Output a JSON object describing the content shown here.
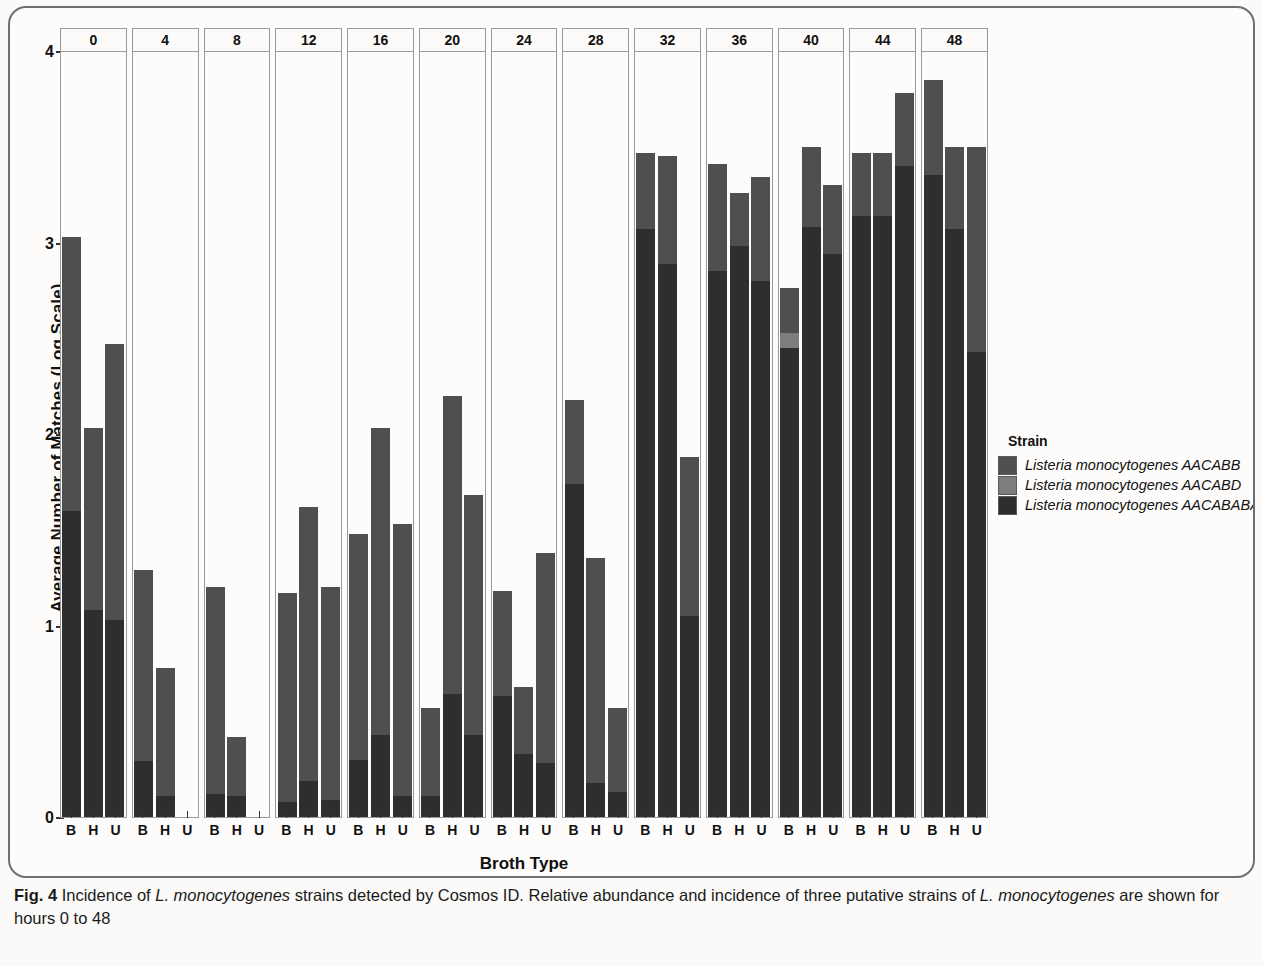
{
  "figure": {
    "label": "Fig. 4",
    "caption_part1": "Incidence of ",
    "caption_italic1": "L. monocytogenes",
    "caption_part2": " strains detected by Cosmos ID. Relative abundance and incidence of three putative strains of ",
    "caption_italic2": "L. monocytogenes",
    "caption_part3": " are shown for hours 0 to 48"
  },
  "legend": {
    "title": "Strain",
    "items": [
      {
        "label": "Listeria monocytogenes AACABB",
        "color": "#4f4f4f"
      },
      {
        "label": "Listeria monocytogenes AACABD",
        "color": "#7d7d7d"
      },
      {
        "label": "Listeria monocytogenes AACABABA",
        "color": "#2e2e2e"
      }
    ]
  },
  "chart_data": {
    "type": "bar",
    "subtype": "stacked-bar-faceted",
    "title": "",
    "xlabel": "Broth Type",
    "ylabel": "Average Number of Matches (Log Scale)",
    "ylim": [
      0,
      4
    ],
    "yticks": [
      0,
      1,
      2,
      3,
      4
    ],
    "grid": false,
    "legend_position": "right",
    "facet_label": "Hour",
    "facets": [
      "0",
      "4",
      "8",
      "12",
      "16",
      "20",
      "24",
      "28",
      "32",
      "36",
      "40",
      "44",
      "48"
    ],
    "categories": [
      "B",
      "H",
      "U"
    ],
    "series": [
      {
        "name": "Listeria monocytogenes AACABB",
        "color": "#4f4f4f"
      },
      {
        "name": "Listeria monocytogenes AACABD",
        "color": "#7d7d7d"
      },
      {
        "name": "Listeria monocytogenes AACABABA",
        "color": "#2e2e2e"
      }
    ],
    "panels": [
      {
        "facet": "0",
        "bars": [
          {
            "category": "B",
            "total": 3.03,
            "segments": [
              1.43,
              0.0,
              1.6
            ]
          },
          {
            "category": "H",
            "total": 2.03,
            "segments": [
              0.95,
              0.0,
              1.08
            ]
          },
          {
            "category": "U",
            "total": 2.47,
            "segments": [
              1.44,
              0.0,
              1.03
            ]
          }
        ]
      },
      {
        "facet": "4",
        "bars": [
          {
            "category": "B",
            "total": 1.29,
            "segments": [
              1.0,
              0.0,
              0.29
            ]
          },
          {
            "category": "H",
            "total": 0.78,
            "segments": [
              0.67,
              0.0,
              0.11
            ]
          },
          {
            "category": "U",
            "total": 0.0,
            "segments": [
              0.0,
              0.0,
              0.0
            ]
          }
        ]
      },
      {
        "facet": "8",
        "bars": [
          {
            "category": "B",
            "total": 1.2,
            "segments": [
              1.08,
              0.0,
              0.12
            ]
          },
          {
            "category": "H",
            "total": 0.42,
            "segments": [
              0.31,
              0.0,
              0.11
            ]
          },
          {
            "category": "U",
            "total": 0.0,
            "segments": [
              0.0,
              0.0,
              0.0
            ]
          }
        ]
      },
      {
        "facet": "12",
        "bars": [
          {
            "category": "B",
            "total": 1.17,
            "segments": [
              1.09,
              0.0,
              0.08
            ]
          },
          {
            "category": "H",
            "total": 1.62,
            "segments": [
              1.43,
              0.0,
              0.19
            ]
          },
          {
            "category": "U",
            "total": 1.2,
            "segments": [
              1.11,
              0.0,
              0.09
            ]
          }
        ]
      },
      {
        "facet": "16",
        "bars": [
          {
            "category": "B",
            "total": 1.48,
            "segments": [
              1.18,
              0.0,
              0.3
            ]
          },
          {
            "category": "H",
            "total": 2.03,
            "segments": [
              1.6,
              0.0,
              0.43
            ]
          },
          {
            "category": "U",
            "total": 1.53,
            "segments": [
              1.42,
              0.0,
              0.11
            ]
          }
        ]
      },
      {
        "facet": "20",
        "bars": [
          {
            "category": "B",
            "total": 0.57,
            "segments": [
              0.46,
              0.0,
              0.11
            ]
          },
          {
            "category": "H",
            "total": 2.2,
            "segments": [
              1.56,
              0.0,
              0.64
            ]
          },
          {
            "category": "U",
            "total": 1.68,
            "segments": [
              1.25,
              0.0,
              0.43
            ]
          }
        ]
      },
      {
        "facet": "24",
        "bars": [
          {
            "category": "B",
            "total": 1.18,
            "segments": [
              0.55,
              0.0,
              0.63
            ]
          },
          {
            "category": "H",
            "total": 0.68,
            "segments": [
              0.35,
              0.0,
              0.33
            ]
          },
          {
            "category": "U",
            "total": 1.38,
            "segments": [
              1.1,
              0.0,
              0.28
            ]
          }
        ]
      },
      {
        "facet": "28",
        "bars": [
          {
            "category": "B",
            "total": 2.18,
            "segments": [
              0.44,
              0.0,
              1.74
            ]
          },
          {
            "category": "H",
            "total": 1.35,
            "segments": [
              1.17,
              0.0,
              0.18
            ]
          },
          {
            "category": "U",
            "total": 0.57,
            "segments": [
              0.44,
              0.0,
              0.13
            ]
          }
        ]
      },
      {
        "facet": "32",
        "bars": [
          {
            "category": "B",
            "total": 3.47,
            "segments": [
              0.4,
              0.0,
              3.07
            ]
          },
          {
            "category": "H",
            "total": 3.45,
            "segments": [
              0.56,
              0.0,
              2.89
            ]
          },
          {
            "category": "U",
            "total": 1.88,
            "segments": [
              0.83,
              0.0,
              1.05
            ]
          }
        ]
      },
      {
        "facet": "36",
        "bars": [
          {
            "category": "B",
            "total": 3.41,
            "segments": [
              0.56,
              0.0,
              2.85
            ]
          },
          {
            "category": "H",
            "total": 3.26,
            "segments": [
              0.28,
              0.0,
              2.98
            ]
          },
          {
            "category": "U",
            "total": 3.34,
            "segments": [
              0.54,
              0.0,
              2.8
            ]
          }
        ]
      },
      {
        "facet": "40",
        "bars": [
          {
            "category": "B",
            "total": 2.76,
            "segments": [
              0.23,
              0.08,
              2.45
            ]
          },
          {
            "category": "H",
            "total": 3.5,
            "segments": [
              0.42,
              0.0,
              3.08
            ]
          },
          {
            "category": "U",
            "total": 3.3,
            "segments": [
              0.36,
              0.0,
              2.94
            ]
          }
        ]
      },
      {
        "facet": "44",
        "bars": [
          {
            "category": "B",
            "total": 3.47,
            "segments": [
              0.33,
              0.0,
              3.14
            ]
          },
          {
            "category": "H",
            "total": 3.47,
            "segments": [
              0.33,
              0.0,
              3.14
            ]
          },
          {
            "category": "U",
            "total": 3.78,
            "segments": [
              0.38,
              0.0,
              3.4
            ]
          }
        ]
      },
      {
        "facet": "48",
        "bars": [
          {
            "category": "B",
            "total": 3.85,
            "segments": [
              0.5,
              0.0,
              3.35
            ]
          },
          {
            "category": "H",
            "total": 3.5,
            "segments": [
              0.43,
              0.0,
              3.07
            ]
          },
          {
            "category": "U",
            "total": 3.5,
            "segments": [
              1.07,
              0.0,
              2.43
            ]
          }
        ]
      }
    ]
  }
}
